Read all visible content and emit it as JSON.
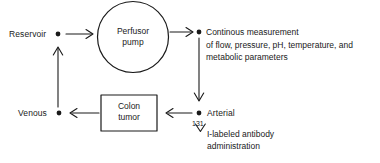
{
  "diagram": {
    "type": "flow-diagram",
    "background_color": "#ffffff",
    "stroke_color": "#1a1a1a",
    "nodes": {
      "reservoir": {
        "label": "Reservoir"
      },
      "pump": {
        "label_line1": "Perfusor",
        "label_line2": "pump",
        "shape": "circle"
      },
      "measurement": {
        "line1": "Continous measurement",
        "line2": "of flow, pressure, pH, temperature, and",
        "line3": "metabolic parameters"
      },
      "arterial": {
        "label": "Arterial"
      },
      "tumor": {
        "label_line1": "Colon",
        "label_line2": "tumor",
        "shape": "rectangle"
      },
      "venous": {
        "label": "Venous"
      },
      "antibody": {
        "isotope": "131",
        "line1": "I-labeled antibody",
        "line2": "administration"
      }
    }
  }
}
